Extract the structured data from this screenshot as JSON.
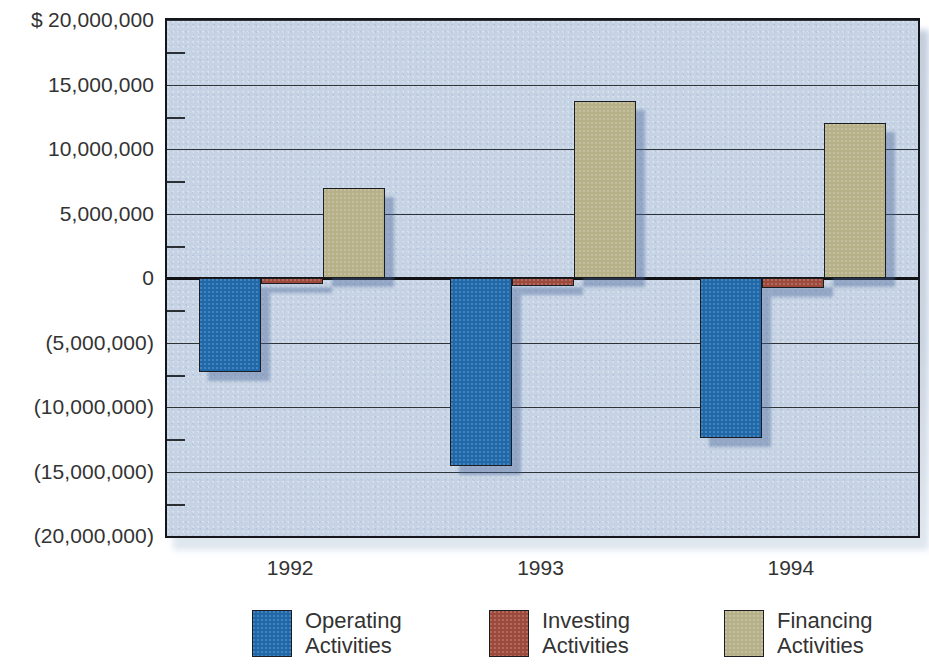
{
  "chart_data": {
    "type": "bar",
    "title": "",
    "subtitle": "",
    "xlabel": "",
    "ylabel": "",
    "currency_symbol": "$",
    "categories": [
      "1992",
      "1993",
      "1994"
    ],
    "series": [
      {
        "name": "Operating Activities",
        "color": "#1f68aa",
        "values": [
          -7300000,
          -14600000,
          -12400000
        ]
      },
      {
        "name": "Investing Activities",
        "color": "#9d4a3d",
        "values": [
          -500000,
          -600000,
          -800000
        ]
      },
      {
        "name": "Financing Activities",
        "color": "#b7b189",
        "values": [
          7000000,
          13700000,
          12000000
        ]
      }
    ],
    "ylim": [
      -20000000,
      20000000
    ],
    "ytick_values": [
      20000000,
      15000000,
      10000000,
      5000000,
      0,
      -5000000,
      -10000000,
      -15000000,
      -20000000
    ],
    "ytick_labels": [
      "20,000,000",
      "15,000,000",
      "10,000,000",
      "5,000,000",
      "0",
      "(5,000,000)",
      "(10,000,000)",
      "(15,000,000)",
      "(20,000,000)"
    ],
    "minor_tick_values": [
      17500000,
      12500000,
      7500000,
      2500000,
      -2500000,
      -7500000,
      -12500000,
      -17500000
    ],
    "grid": true,
    "legend_position": "bottom",
    "legend_entries": [
      {
        "label_line1": "Operating",
        "label_line2": "Activities",
        "color": "#1f68aa"
      },
      {
        "label_line1": "Investing",
        "label_line2": "Activities",
        "color": "#9d4a3d"
      },
      {
        "label_line1": "Financing",
        "label_line2": "Activities",
        "color": "#b7b189"
      }
    ],
    "plot_background": "#c6d3e4",
    "axis_color": "#14161c"
  }
}
